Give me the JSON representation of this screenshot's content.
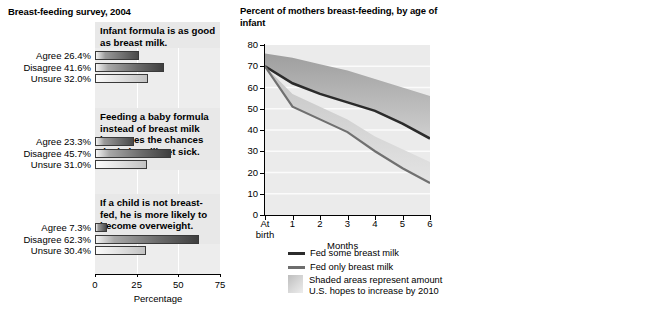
{
  "left_panel": {
    "title": "Breast-feeding survey, 2004",
    "axis_label": "Percentage",
    "x_ticks": [
      "0",
      "25",
      "50",
      "75"
    ],
    "x_range": [
      0,
      75
    ],
    "questions": [
      {
        "statement": "Infant formula is as good as breast milk.",
        "responses": [
          {
            "label": "Agree 26.4%",
            "key": "Agree",
            "value": 26.4
          },
          {
            "label": "Disagree 41.6%",
            "key": "Disagree",
            "value": 41.6
          },
          {
            "label": "Unsure 32.0%",
            "key": "Unsure",
            "value": 32.0
          }
        ]
      },
      {
        "statement": "Feeding a baby formula instead of breast milk increases the chances the baby will get sick.",
        "responses": [
          {
            "label": "Agree 23.3%",
            "key": "Agree",
            "value": 23.3
          },
          {
            "label": "Disagree 45.7%",
            "key": "Disagree",
            "value": 45.7
          },
          {
            "label": "Unsure 31.0%",
            "key": "Unsure",
            "value": 31.0
          }
        ]
      },
      {
        "statement": "If a child is not breast-fed, he is more likely to become overweight.",
        "responses": [
          {
            "label": "Agree 7.3%",
            "key": "Agree",
            "value": 7.3
          },
          {
            "label": "Disagree 62.3%",
            "key": "Disagree",
            "value": 62.3
          },
          {
            "label": "Unsure 30.4%",
            "key": "Unsure",
            "value": 30.4
          }
        ]
      }
    ]
  },
  "middle_panel": {
    "title": "Percent of mothers breast-feeding, by age of infant",
    "x_label": "Months",
    "y_ticks": [
      "80",
      "70",
      "60",
      "50",
      "40",
      "30",
      "20",
      "10",
      "0"
    ],
    "x_ticks": [
      "At birth",
      "1",
      "2",
      "3",
      "4",
      "5",
      "6"
    ],
    "legend": [
      {
        "type": "line",
        "label": "Fed some breast milk",
        "color": "#2b2b2b"
      },
      {
        "type": "line",
        "label": "Fed only breast milk",
        "color": "#6d6d6d"
      },
      {
        "type": "swatch",
        "label": "Shaded areas represent amount U.S. hopes to increase by 2010"
      }
    ]
  },
  "right_panel": {
    "axis_label": "Percentage",
    "x_ticks": [
      "0",
      "25",
      "50",
      "75",
      "100"
    ],
    "x_range": [
      0,
      100
    ],
    "groups": [
      {
        "header": "By race",
        "bars": [
          {
            "label": "White",
            "value": 71
          },
          {
            "label": "Black",
            "value": 51
          },
          {
            "label": "Hispanic",
            "value": 80
          },
          {
            "label": "Asian",
            "value": 72
          }
        ]
      },
      {
        "header": "By age of mother",
        "bars": [
          {
            "label": "<20",
            "value": 71
          },
          {
            "label": "20–29",
            "value": 54
          },
          {
            "label": "≥30",
            "value": 79
          }
        ]
      },
      {
        "header": "By education",
        "bars": [
          {
            "label": "High school",
            "value": 71
          },
          {
            "label": "Some college",
            "value": 53
          },
          {
            "label": "College grad",
            "value": 80
          }
        ]
      },
      {
        "header": "By marital status",
        "bars": [
          {
            "label": "Married",
            "value": 69
          },
          {
            "label": "Unmarried",
            "value": 49
          }
        ]
      },
      {
        "header": "By income",
        "bars": [
          {
            "label": "Below poverty",
            "value": 69
          },
          {
            "label": "High income",
            "value": 49
          }
        ]
      }
    ]
  },
  "chart_data": [
    {
      "type": "bar",
      "orientation": "horizontal",
      "title": "Breast-feeding survey, 2004",
      "xlabel": "Percentage",
      "ylabel": "",
      "xlim": [
        0,
        75
      ],
      "grid": true,
      "panels": [
        {
          "statement": "Infant formula is as good as breast milk.",
          "categories": [
            "Agree",
            "Disagree",
            "Unsure"
          ],
          "values": [
            26.4,
            41.6,
            32.0
          ]
        },
        {
          "statement": "Feeding a baby formula instead of breast milk increases the chances the baby will get sick.",
          "categories": [
            "Agree",
            "Disagree",
            "Unsure"
          ],
          "values": [
            23.3,
            45.7,
            31.0
          ]
        },
        {
          "statement": "If a child is not breast-fed, he is more likely to become overweight.",
          "categories": [
            "Agree",
            "Disagree",
            "Unsure"
          ],
          "values": [
            7.3,
            62.3,
            30.4
          ]
        }
      ]
    },
    {
      "type": "line",
      "title": "Percent of mothers breast-feeding, by age of infant",
      "xlabel": "Months",
      "ylabel": "",
      "xlim": [
        0,
        6
      ],
      "ylim": [
        0,
        80
      ],
      "grid": true,
      "legend_position": "below",
      "x": [
        "At birth",
        1,
        2,
        3,
        4,
        5,
        6
      ],
      "series": [
        {
          "name": "Fed some breast milk",
          "values": [
            70,
            62,
            57,
            53,
            49,
            43,
            36
          ]
        },
        {
          "name": "Fed only breast milk",
          "values": [
            70,
            51,
            45,
            39,
            30,
            22,
            15
          ]
        },
        {
          "name": "2010 target (upper band, fed some)",
          "values": [
            76,
            74,
            71,
            68,
            64,
            60,
            56
          ]
        },
        {
          "name": "2010 target (upper band, fed only)",
          "values": [
            70,
            57,
            51,
            45,
            37,
            31,
            25
          ]
        }
      ],
      "annotations": [
        "Shaded areas represent amount U.S. hopes to increase by 2010"
      ]
    },
    {
      "type": "bar",
      "orientation": "horizontal",
      "title": "",
      "xlabel": "Percentage",
      "xlim": [
        0,
        100
      ],
      "grid": true,
      "groups": [
        {
          "name": "By race",
          "categories": [
            "White",
            "Black",
            "Hispanic",
            "Asian"
          ],
          "values": [
            71,
            51,
            80,
            72
          ]
        },
        {
          "name": "By age of mother",
          "categories": [
            "<20",
            "20–29",
            "≥30"
          ],
          "values": [
            71,
            54,
            79
          ]
        },
        {
          "name": "By education",
          "categories": [
            "High school",
            "Some college",
            "College grad"
          ],
          "values": [
            71,
            53,
            80
          ]
        },
        {
          "name": "By marital status",
          "categories": [
            "Married",
            "Unmarried"
          ],
          "values": [
            69,
            49
          ]
        },
        {
          "name": "By income",
          "categories": [
            "Below poverty",
            "High income"
          ],
          "values": [
            69,
            49
          ]
        }
      ]
    }
  ]
}
